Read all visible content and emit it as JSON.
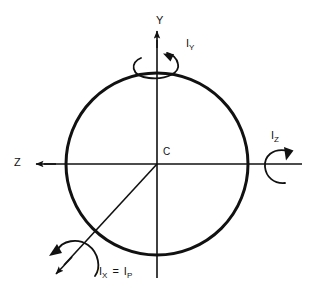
{
  "diagram": {
    "background_color": "#ffffff",
    "stroke_color": "#111111",
    "circle": {
      "center_label": "C",
      "center_x": 157,
      "center_y": 164,
      "radius": 91,
      "stroke_width": 3
    },
    "axes": [
      {
        "name": "y-axis",
        "label": "Y",
        "direction": "up",
        "arrow": true
      },
      {
        "name": "z-axis",
        "label": "Z",
        "direction": "left",
        "arrow": true
      },
      {
        "name": "x-axis",
        "label": "X",
        "direction": "lower-left-diagonal",
        "arrow": true
      }
    ],
    "moment_labels": [
      {
        "name": "iy-label",
        "symbol": "I",
        "subscript": "Y",
        "text": "IY"
      },
      {
        "name": "iz-label",
        "symbol": "I",
        "subscript": "Z",
        "text": "IZ"
      },
      {
        "name": "ix-label",
        "symbol": "I",
        "subscript": "X",
        "equals": "=",
        "symbol2": "I",
        "subscript2": "P",
        "text": "IX = IP"
      }
    ],
    "rotation_arrows": [
      {
        "name": "iy-rotation-arrow",
        "about": "Y"
      },
      {
        "name": "iz-rotation-arrow",
        "about": "Z"
      },
      {
        "name": "ix-rotation-arrow",
        "about": "X"
      }
    ]
  },
  "labels": {
    "y": "Y",
    "z": "Z",
    "c": "C",
    "iy_symbol": "I",
    "iy_sub": "Y",
    "iz_symbol": "I",
    "iz_sub": "Z",
    "ix_symbol": "I",
    "ix_sub": "X",
    "ix_equals": "=",
    "ip_symbol": "I",
    "ip_sub": "P"
  }
}
